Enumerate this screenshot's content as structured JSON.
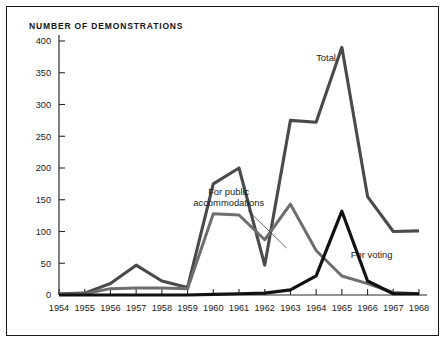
{
  "figure": {
    "title": "NUMBER OF DEMONSTRATIONS",
    "background": "#ffffff",
    "border_color": "#1a1a1a"
  },
  "chart_data": {
    "type": "line",
    "title": "NUMBER OF DEMONSTRATIONS",
    "xlabel": "",
    "ylabel": "",
    "xlim": [
      1954,
      1968
    ],
    "ylim": [
      0,
      400
    ],
    "grid": false,
    "legend_position": "inline-annotations",
    "x": [
      1954,
      1955,
      1956,
      1957,
      1958,
      1959,
      1960,
      1961,
      1962,
      1963,
      1964,
      1965,
      1966,
      1967,
      1968
    ],
    "xtick_labels": [
      "1954",
      "1955",
      "1956",
      "1957",
      "1958",
      "1959",
      "1960",
      "1961",
      "1962",
      "1963",
      "1964",
      "1965",
      "1966",
      "1967",
      "1968"
    ],
    "ytick_labels": [
      "0",
      "50",
      "100",
      "150",
      "200",
      "250",
      "300",
      "350",
      "400"
    ],
    "yticks": [
      0,
      50,
      100,
      150,
      200,
      250,
      300,
      350,
      400
    ],
    "series": [
      {
        "name": "Total",
        "color": "#4a4a4a",
        "width": 3.1,
        "label": "Total",
        "label_x": 1964.0,
        "label_y": 368,
        "values": [
          2,
          3,
          18,
          47,
          22,
          12,
          175,
          200,
          47,
          275,
          272,
          390,
          155,
          100,
          101
        ]
      },
      {
        "name": "For public accommodations",
        "color": "#6e6e6e",
        "width": 3.0,
        "label": "For public\naccommodations",
        "label_lines": [
          "For public",
          "accommodations"
        ],
        "label_x": 1960.6,
        "label_y": 158,
        "leader_from": [
          1961.35,
          133
        ],
        "leader_to": [
          1962.85,
          74
        ],
        "values": [
          1,
          2,
          10,
          11,
          11,
          10,
          128,
          126,
          87,
          143,
          70,
          30,
          18,
          4,
          2
        ]
      },
      {
        "name": "For voting",
        "color": "#111111",
        "width": 3.2,
        "label": "For voting",
        "label_x": 1965.35,
        "label_y": 58,
        "values": [
          0,
          0,
          0,
          0,
          0,
          0,
          1,
          2,
          3,
          8,
          30,
          132,
          22,
          2,
          2
        ]
      }
    ]
  }
}
